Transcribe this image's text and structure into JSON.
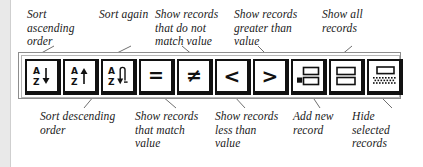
{
  "figure": {
    "type": "annotated-toolbar-diagram"
  },
  "toolbar": {
    "buttons": [
      {
        "id": "sort-ascending",
        "icon": "sort-ascending-icon",
        "glyph_letters": [
          "A",
          "Z"
        ],
        "glyph_arrow": "down-arrow",
        "label": "Sort\nascending\norder"
      },
      {
        "id": "sort-descending",
        "icon": "sort-descending-icon",
        "glyph_letters": [
          "A",
          "Z"
        ],
        "glyph_arrow": "up-arrow",
        "label": "Sort descending\norder"
      },
      {
        "id": "sort-again",
        "icon": "sort-again-icon",
        "glyph_letters": [
          "A",
          "Z"
        ],
        "glyph_arrow": "loop-arrow",
        "label": "Sort again"
      },
      {
        "id": "find-equal",
        "icon": "equals-icon",
        "glyph_symbol": "=",
        "label": "Show records\nthat match\nvalue"
      },
      {
        "id": "find-not-equal",
        "icon": "not-equals-icon",
        "glyph_symbol": "≠",
        "label": "Show records\nthat do not\nmatch value"
      },
      {
        "id": "find-less-than",
        "icon": "less-than-icon",
        "glyph_symbol": "<",
        "label": "Show records\nless than\nvalue"
      },
      {
        "id": "find-greater-than",
        "icon": "greater-than-icon",
        "glyph_symbol": ">",
        "label": "Show records\ngreater than\nvalue"
      },
      {
        "id": "add-new-record",
        "icon": "add-record-icon",
        "label": "Add new\nrecord"
      },
      {
        "id": "show-all-records",
        "icon": "show-all-records-icon",
        "label": "Show all\nrecords"
      },
      {
        "id": "hide-selected-records",
        "icon": "hide-selected-records-icon",
        "label": "Hide\nselected\nrecords"
      }
    ]
  },
  "callouts": {
    "top": [
      {
        "id": "sort-ascending",
        "text": "Sort\nascending\norder"
      },
      {
        "id": "sort-again",
        "text": "Sort again"
      },
      {
        "id": "find-not-equal",
        "text": "Show records\nthat do not\nmatch value"
      },
      {
        "id": "find-greater-than",
        "text": "Show records\ngreater than\nvalue"
      },
      {
        "id": "show-all-records",
        "text": "Show all\nrecords"
      }
    ],
    "bottom": [
      {
        "id": "sort-descending",
        "text": "Sort descending\norder"
      },
      {
        "id": "find-equal",
        "text": "Show records\nthat match\nvalue"
      },
      {
        "id": "find-less-than",
        "text": "Show records\nless than\nvalue"
      },
      {
        "id": "add-new-record",
        "text": "Add new\nrecord"
      },
      {
        "id": "hide-selected-records",
        "text": "Hide\nselected\nrecords"
      }
    ]
  },
  "colors": {
    "ink": "#1a1a1a",
    "button_border": "#111111",
    "toolbar_frame": "#8d8d8d",
    "page_background": "#ffffff",
    "page_edge_band": "#e9e9e9"
  }
}
